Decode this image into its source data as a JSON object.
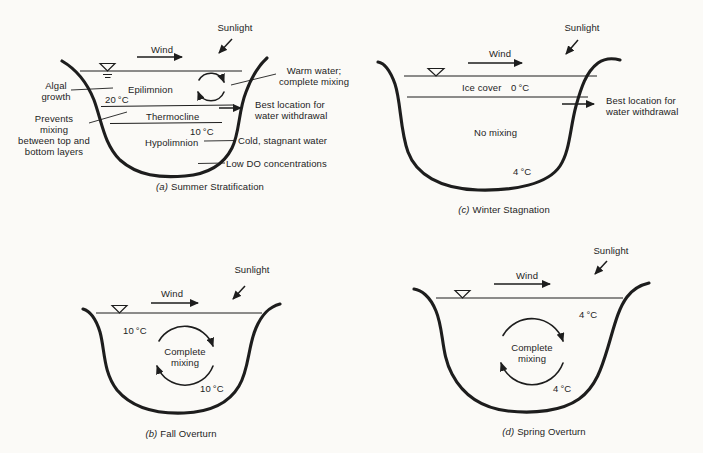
{
  "colors": {
    "ink": "#1d1d1d",
    "paper": "#fbfaf7"
  },
  "panels": {
    "summer": {
      "caption_letter": "(a)",
      "caption_title": "Summer Stratification",
      "sunlight_label": "Sunlight",
      "wind_label": "Wind",
      "labels": {
        "algal_growth": "Algal\ngrowth",
        "epilimnion": "Epilimnion",
        "epilimnion_temp": "20 °C",
        "thermocline": "Thermocline",
        "hypolimnion_temp": "10 °C",
        "hypolimnion": "Hypolimnion",
        "prevents_mixing": "Prevents\nmixing\nbetween top and\nbottom layers",
        "warm_water": "Warm water;\ncomplete mixing",
        "best_location": "Best location for\nwater withdrawal",
        "cold_stagnant": "Cold, stagnant water",
        "low_do": "Low DO concentrations"
      }
    },
    "winter": {
      "caption_letter": "(c)",
      "caption_title": "Winter Stagnation",
      "sunlight_label": "Sunlight",
      "wind_label": "Wind",
      "labels": {
        "ice_cover": "Ice cover",
        "ice_temp": "0 °C",
        "best_location": "Best location for\nwater withdrawal",
        "no_mixing": "No mixing",
        "bottom_temp": "4 °C"
      }
    },
    "fall": {
      "caption_letter": "(b)",
      "caption_title": "Fall Overturn",
      "sunlight_label": "Sunlight",
      "wind_label": "Wind",
      "labels": {
        "top_temp": "10 °C",
        "complete_mixing": "Complete\nmixing",
        "bottom_temp": "10 °C"
      }
    },
    "spring": {
      "caption_letter": "(d)",
      "caption_title": "Spring Overturn",
      "sunlight_label": "Sunlight",
      "wind_label": "Wind",
      "labels": {
        "top_temp": "4 °C",
        "complete_mixing": "Complete\nmixing",
        "bottom_temp": "4 °C"
      }
    }
  }
}
